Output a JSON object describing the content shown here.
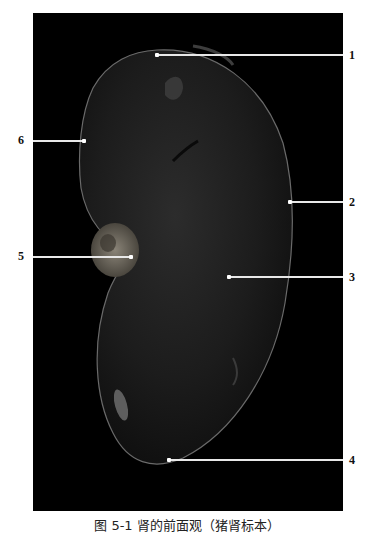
{
  "figure": {
    "caption": "图 5-1  肾的前面观（猪肾标本）",
    "background_color": "#000000",
    "specimen_color": "#1e1e1e",
    "labels": [
      {
        "id": "1",
        "text": "1"
      },
      {
        "id": "2",
        "text": "2"
      },
      {
        "id": "3",
        "text": "3"
      },
      {
        "id": "4",
        "text": "4"
      },
      {
        "id": "5",
        "text": "5"
      },
      {
        "id": "6",
        "text": "6"
      }
    ]
  }
}
